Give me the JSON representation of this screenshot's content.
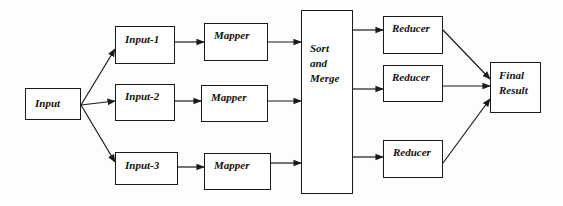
{
  "diagram": {
    "type": "flowchart",
    "title": "",
    "nodes": [
      {
        "id": "input",
        "label": "Input",
        "x": 25,
        "y": 88,
        "w": 56,
        "h": 32,
        "lx": 9,
        "ly": 8
      },
      {
        "id": "input1",
        "label": "Input-1",
        "x": 115,
        "y": 26,
        "w": 60,
        "h": 38,
        "lx": 9,
        "ly": 6
      },
      {
        "id": "input2",
        "label": "Input-2",
        "x": 115,
        "y": 84,
        "w": 60,
        "h": 37,
        "lx": 9,
        "ly": 5
      },
      {
        "id": "input3",
        "label": "Input-3",
        "x": 115,
        "y": 152,
        "w": 63,
        "h": 33,
        "lx": 9,
        "ly": 6
      },
      {
        "id": "mapper1",
        "label": "Mapper",
        "x": 204,
        "y": 23,
        "w": 64,
        "h": 38,
        "lx": 9,
        "ly": 5
      },
      {
        "id": "mapper2",
        "label": "Mapper",
        "x": 201,
        "y": 85,
        "w": 67,
        "h": 37,
        "lx": 9,
        "ly": 5
      },
      {
        "id": "mapper3",
        "label": "Mapper",
        "x": 204,
        "y": 153,
        "w": 67,
        "h": 37,
        "lx": 9,
        "ly": 5
      },
      {
        "id": "sort",
        "label": "Sort\nand\nMerge",
        "x": 301,
        "y": 10,
        "w": 52,
        "h": 184,
        "lx": 8,
        "ly": 30
      },
      {
        "id": "reducer1",
        "label": "Reducer",
        "x": 383,
        "y": 16,
        "w": 60,
        "h": 38,
        "lx": 8,
        "ly": 5
      },
      {
        "id": "reducer2",
        "label": "Reducer",
        "x": 383,
        "y": 65,
        "w": 60,
        "h": 37,
        "lx": 8,
        "ly": 5
      },
      {
        "id": "reducer3",
        "label": "Reducer",
        "x": 383,
        "y": 140,
        "w": 60,
        "h": 38,
        "lx": 9,
        "ly": 5
      },
      {
        "id": "final",
        "label": "Final\nResult",
        "x": 490,
        "y": 62,
        "w": 51,
        "h": 51,
        "lx": 8,
        "ly": 5
      }
    ],
    "edges": [
      {
        "from": "input",
        "to": "input1",
        "points": [
          [
            81,
            105
          ],
          [
            115,
            49
          ]
        ]
      },
      {
        "from": "input",
        "to": "input2",
        "points": [
          [
            81,
            105
          ],
          [
            115,
            101
          ]
        ]
      },
      {
        "from": "input",
        "to": "input3",
        "points": [
          [
            81,
            105
          ],
          [
            115,
            162
          ]
        ]
      },
      {
        "from": "input1",
        "to": "mapper1",
        "points": [
          [
            175,
            42
          ],
          [
            204,
            42
          ]
        ]
      },
      {
        "from": "input2",
        "to": "mapper2",
        "points": [
          [
            175,
            101
          ],
          [
            201,
            101
          ]
        ]
      },
      {
        "from": "input3",
        "to": "mapper3",
        "points": [
          [
            178,
            167
          ],
          [
            204,
            167
          ]
        ]
      },
      {
        "from": "mapper1",
        "to": "sort",
        "points": [
          [
            268,
            42
          ],
          [
            301,
            42
          ]
        ]
      },
      {
        "from": "mapper2",
        "to": "sort",
        "points": [
          [
            268,
            101
          ],
          [
            301,
            101
          ]
        ]
      },
      {
        "from": "mapper3",
        "to": "sort",
        "points": [
          [
            271,
            163
          ],
          [
            301,
            163
          ]
        ]
      },
      {
        "from": "sort",
        "to": "reducer1",
        "points": [
          [
            353,
            30
          ],
          [
            383,
            30
          ]
        ]
      },
      {
        "from": "sort",
        "to": "reducer2",
        "points": [
          [
            353,
            89
          ],
          [
            383,
            89
          ]
        ]
      },
      {
        "from": "sort",
        "to": "reducer3",
        "points": [
          [
            353,
            157
          ],
          [
            383,
            157
          ]
        ]
      },
      {
        "from": "reducer1",
        "to": "final",
        "points": [
          [
            443,
            30
          ],
          [
            490,
            79
          ]
        ]
      },
      {
        "from": "reducer2",
        "to": "final",
        "points": [
          [
            443,
            86
          ],
          [
            490,
            86
          ]
        ]
      },
      {
        "from": "reducer3",
        "to": "final",
        "points": [
          [
            443,
            163
          ],
          [
            490,
            99
          ]
        ]
      }
    ],
    "colors": {
      "stroke": "#1a1a1a",
      "fill": "#ffffff",
      "text": "#111111",
      "background": "#fdfdfd"
    }
  }
}
